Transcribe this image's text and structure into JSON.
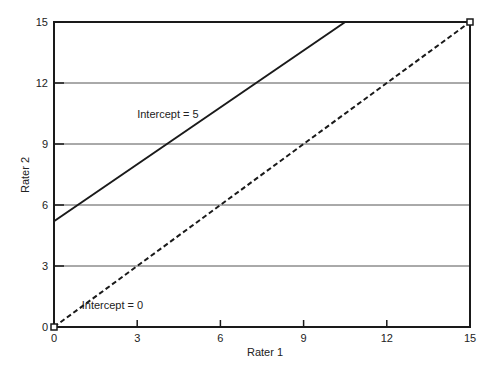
{
  "chart_data": {
    "type": "line",
    "title": "",
    "xlabel": "Rater 1",
    "ylabel": "Rater 2",
    "xlim": [
      0,
      15
    ],
    "ylim": [
      0,
      15
    ],
    "x_ticks": [
      0,
      3,
      6,
      9,
      12,
      15
    ],
    "y_ticks": [
      0,
      3,
      6,
      9,
      12,
      15
    ],
    "grid": {
      "horizontal": true,
      "vertical": false,
      "color": "#555555"
    },
    "legend": null,
    "series": [
      {
        "name": "Intercept = 5",
        "style": "solid",
        "color": "#1a1a1a",
        "x": [
          0,
          10.5
        ],
        "y": [
          5.2,
          15
        ]
      },
      {
        "name": "Intercept = 0",
        "style": "dashed",
        "color": "#1a1a1a",
        "x": [
          0,
          15
        ],
        "y": [
          0,
          15
        ]
      }
    ],
    "annotations": [
      {
        "text": "Intercept = 5",
        "x": 3.0,
        "y": 10.3
      },
      {
        "text": "Intercept = 0",
        "x": 1.0,
        "y": 0.9
      }
    ],
    "markers": [
      {
        "x": 0,
        "y": 0,
        "shape": "square"
      },
      {
        "x": 15,
        "y": 15,
        "shape": "square"
      }
    ]
  }
}
